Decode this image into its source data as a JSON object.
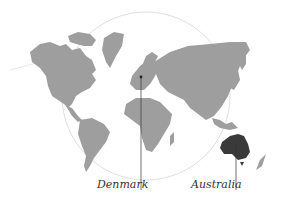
{
  "map": {
    "type": "world-map",
    "colors": {
      "land": "#9e9e9e",
      "highlight": "#3a3a3a",
      "circle": "#d6d6d6",
      "leader_line": "#333333",
      "background": "#ffffff"
    },
    "markers": [
      {
        "name": "Denmark",
        "label": "Denmark",
        "highlighted": false
      },
      {
        "name": "Australia",
        "label": "Australia",
        "highlighted": true
      }
    ]
  }
}
